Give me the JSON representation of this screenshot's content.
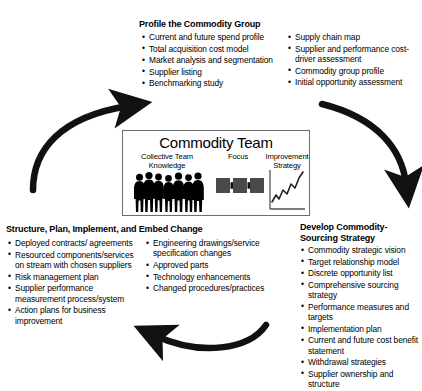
{
  "diagram": {
    "accent_color": "#000000",
    "box_border_color": "#6e6e6e",
    "square_fill": "#4a4a4a",
    "arrow_color": "#111111"
  },
  "center": {
    "title": "Commodity Team",
    "panels": [
      {
        "id": "knowledge",
        "label": "Collective Team\nKnowledge",
        "label_line1": "Collective Team",
        "label_line2": "Knowledge",
        "icon": "people-group-icon"
      },
      {
        "id": "focus",
        "label": "Focus",
        "label_line1": "Focus",
        "label_line2": "",
        "icon": "squares-arrows-icon"
      },
      {
        "id": "strategy",
        "label": "Improvement\nStrategy",
        "label_line1": "Improvement",
        "label_line2": "Strategy",
        "icon": "rising-line-chart-icon"
      }
    ],
    "people_count": 7,
    "focus_squares": 3,
    "focus_arrows": 2
  },
  "flow_arrows": [
    {
      "id": "arrow-left-up",
      "name": "curved-arrow-up-left",
      "from": "Structure, Plan, Implement, and Embed Change",
      "to": "Profile the Commodity Group",
      "direction": "clockwise"
    },
    {
      "id": "arrow-right-down",
      "name": "curved-arrow-down-right",
      "from": "Profile the Commodity Group",
      "to": "Develop Commodity-Sourcing Strategy",
      "direction": "clockwise"
    },
    {
      "id": "arrow-bottom-left",
      "name": "curved-arrow-left-bottom",
      "from": "Develop Commodity-Sourcing Strategy",
      "to": "Structure, Plan, Implement, and Embed Change",
      "direction": "clockwise"
    }
  ],
  "sections": {
    "profile": {
      "heading": "Profile the Commodity Group",
      "column_left": [
        "Current and future spend profile",
        "Total acquisition cost model",
        "Market analysis and segmentation",
        "Supplier listing",
        "Benchmarking study"
      ],
      "column_right": [
        "Supply chain map",
        "Supplier and performance cost-driver assessment",
        "Commodity group profile",
        "Initial opportunity assessment"
      ]
    },
    "structure": {
      "heading": "Structure, Plan, Implement, and Embed Change",
      "column_left": [
        "Deployed contracts/ agreements",
        "Resourced components/services on stream with chosen suppliers",
        "Risk management plan",
        "Supplier performance measurement process/system",
        "Action plans for business improvement"
      ],
      "column_right": [
        "Engineering drawings/service specification changes",
        "Approved parts",
        "Technology enhancements",
        "Changed procedures/practices"
      ]
    },
    "develop": {
      "heading_line1": "Develop Commodity-",
      "heading_line2": "Sourcing Strategy",
      "items": [
        "Commodity strategic vision",
        "Target relationship model",
        "Discrete opportunity list",
        "Comprehensive sourcing strategy",
        "Performance measures and targets",
        "Implementation plan",
        "Current and future cost benefit statement",
        "Withdrawal strategies",
        "Supplier ownership and structure"
      ]
    }
  }
}
